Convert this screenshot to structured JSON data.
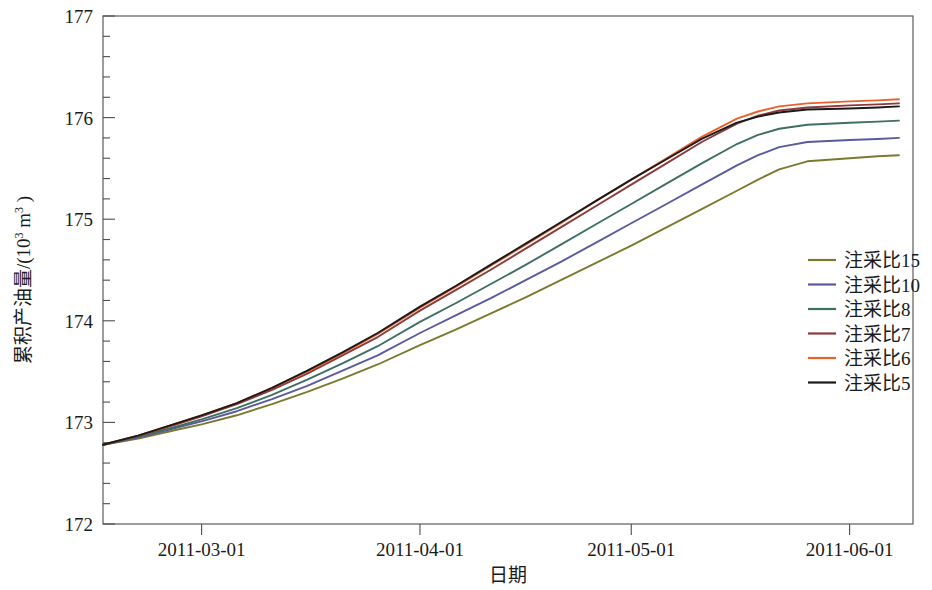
{
  "chart_data": {
    "type": "line",
    "title": "",
    "xlabel": "日期",
    "ylabel": "累积产油量/(10³ m³)",
    "ylabel_main": "累积产油量/(10",
    "ylabel_sup1": "3",
    "ylabel_mid": " m",
    "ylabel_sup2": "3",
    "ylabel_end": " )",
    "grid": false,
    "legend_position": "right-middle",
    "x_type": "date",
    "x_tick_labels": [
      "2011-03-01",
      "2011-04-01",
      "2011-05-01",
      "2011-06-01"
    ],
    "x_tick_values": [
      59,
      90,
      120,
      151
    ],
    "xlim": [
      45,
      160
    ],
    "y_tick_labels": [
      "172",
      "173",
      "174",
      "175",
      "176",
      "177"
    ],
    "y_tick_values": [
      172,
      173,
      174,
      175,
      176,
      177
    ],
    "ylim": [
      172,
      177
    ],
    "y_minor_ticks_per_interval": 5,
    "x": [
      45,
      50,
      55,
      59,
      64,
      69,
      74,
      79,
      84,
      90,
      95,
      100,
      105,
      110,
      115,
      120,
      125,
      130,
      135,
      138,
      141,
      145,
      151,
      155,
      158
    ],
    "series": [
      {
        "name": "注采比15",
        "color": "#7a7a2e",
        "values": [
          172.78,
          172.84,
          172.92,
          172.98,
          173.07,
          173.18,
          173.3,
          173.43,
          173.57,
          173.76,
          173.91,
          174.07,
          174.23,
          174.4,
          174.57,
          174.74,
          174.92,
          175.1,
          175.28,
          175.39,
          175.49,
          175.57,
          175.6,
          175.62,
          175.63
        ]
      },
      {
        "name": "注采比10",
        "color": "#5a5a9e",
        "values": [
          172.78,
          172.85,
          172.94,
          173.01,
          173.11,
          173.23,
          173.36,
          173.51,
          173.66,
          173.88,
          174.05,
          174.22,
          174.4,
          174.58,
          174.77,
          174.96,
          175.15,
          175.34,
          175.53,
          175.63,
          175.71,
          175.76,
          175.78,
          175.79,
          175.8
        ]
      },
      {
        "name": "注采比8",
        "color": "#3f6e62",
        "values": [
          172.78,
          172.86,
          172.95,
          173.03,
          173.14,
          173.27,
          173.42,
          173.58,
          173.75,
          173.99,
          174.17,
          174.36,
          174.55,
          174.75,
          174.95,
          175.15,
          175.35,
          175.55,
          175.74,
          175.83,
          175.89,
          175.93,
          175.95,
          175.96,
          175.97
        ]
      },
      {
        "name": "注采比7",
        "color": "#8c3a3a"
      },
      {
        "name": "注采比6",
        "color": "#e8622a"
      },
      {
        "name": "注采比5",
        "color": "#1a1a1a"
      }
    ],
    "series_extra": [
      {
        "name": "注采比7",
        "color": "#8c3a3a",
        "values": [
          172.78,
          172.87,
          172.97,
          173.06,
          173.18,
          173.32,
          173.48,
          173.66,
          173.84,
          174.1,
          174.3,
          174.5,
          174.71,
          174.92,
          175.13,
          175.34,
          175.55,
          175.76,
          175.94,
          176.02,
          176.07,
          176.1,
          176.12,
          176.13,
          176.14
        ]
      },
      {
        "name": "注采比6",
        "color": "#e8622a",
        "values": [
          172.78,
          172.87,
          172.98,
          173.07,
          173.19,
          173.34,
          173.5,
          173.68,
          173.87,
          174.13,
          174.33,
          174.54,
          174.75,
          174.96,
          175.18,
          175.39,
          175.6,
          175.81,
          175.99,
          176.06,
          176.11,
          176.14,
          176.16,
          176.17,
          176.18
        ]
      },
      {
        "name": "注采比5",
        "color": "#1a1a1a",
        "values": [
          172.78,
          172.87,
          172.98,
          173.07,
          173.19,
          173.34,
          173.51,
          173.69,
          173.88,
          174.14,
          174.34,
          174.55,
          174.76,
          174.97,
          175.18,
          175.39,
          175.59,
          175.79,
          175.95,
          176.01,
          176.05,
          176.08,
          176.09,
          176.1,
          176.11
        ]
      }
    ],
    "legend": [
      {
        "label": "注采比15",
        "color": "#7a7a2e"
      },
      {
        "label": "注采比10",
        "color": "#5a5a9e"
      },
      {
        "label": "注采比8",
        "color": "#3f6e62"
      },
      {
        "label": "注采比7",
        "color": "#8c3a3a"
      },
      {
        "label": "注采比6",
        "color": "#e8622a"
      },
      {
        "label": "注采比5",
        "color": "#1a1a1a"
      }
    ]
  }
}
